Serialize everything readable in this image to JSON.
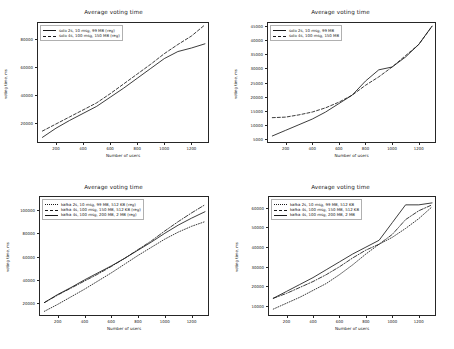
{
  "figure": {
    "layout": "2x2 grid of line charts",
    "panel_count": 4
  },
  "charts": [
    {
      "id": "top-left",
      "title": "Average voting time",
      "xlabel": "Number of users",
      "ylabel": "voting time, ms",
      "yticks": [
        "20000",
        "40000",
        "60000",
        "80000"
      ],
      "xticks": [
        "200",
        "400",
        "600",
        "800",
        "1000",
        "1200"
      ],
      "legend": [
        {
          "label": "solo 2s, 10 msg, 99 MB (reg)",
          "style": "solid"
        },
        {
          "label": "solo 4s, 100 msg, 150 MB (reg)",
          "style": "dashed"
        }
      ]
    },
    {
      "id": "top-right",
      "title": "Average voting time",
      "xlabel": "Number of users",
      "ylabel": "voting time, ms",
      "yticks": [
        "5000",
        "10000",
        "15000",
        "20000",
        "25000",
        "30000",
        "35000",
        "40000",
        "45000"
      ],
      "xticks": [
        "200",
        "400",
        "600",
        "800",
        "1000",
        "1200"
      ],
      "legend": [
        {
          "label": "solo 2s, 10 msg, 99 MB",
          "style": "solid"
        },
        {
          "label": "solo 4s, 100 msg, 150 MB",
          "style": "dashed"
        }
      ]
    },
    {
      "id": "bottom-left",
      "title": "Average voting time",
      "xlabel": "Number of users",
      "ylabel": "voting time, ms",
      "yticks": [
        "20000",
        "40000",
        "60000",
        "80000",
        "100000"
      ],
      "xticks": [
        "200",
        "400",
        "600",
        "800",
        "1000",
        "1200"
      ],
      "legend": [
        {
          "label": "kafka 2s, 10 msg, 99 MB, 512 KB (reg)",
          "style": "dotted"
        },
        {
          "label": "kafka 4s, 100 msg, 150 MB, 512 KB (reg)",
          "style": "dashdot"
        },
        {
          "label": "kafka 4s, 100 msg, 200 MB, 2 MB (reg)",
          "style": "solid"
        }
      ]
    },
    {
      "id": "bottom-right",
      "title": "Average voting time",
      "xlabel": "Number of users",
      "ylabel": "voting time, ms",
      "yticks": [
        "10000",
        "20000",
        "30000",
        "40000",
        "50000",
        "60000"
      ],
      "xticks": [
        "200",
        "400",
        "600",
        "800",
        "1000",
        "1200"
      ],
      "legend": [
        {
          "label": "kafka 2s, 10 msg, 99 MB, 512 KB",
          "style": "dotted"
        },
        {
          "label": "kafka 4s, 100 msg, 150 MB, 512 KB",
          "style": "dashdot"
        },
        {
          "label": "kafka 4s, 100 msg, 200 MB, 2 MB",
          "style": "solid"
        }
      ]
    }
  ],
  "chart_data": [
    {
      "type": "line",
      "panel": "top-left",
      "title": "Average voting time",
      "xlabel": "Number of users",
      "ylabel": "voting time, ms",
      "xlim": [
        60,
        1330
      ],
      "ylim": [
        6000,
        92000
      ],
      "grid": false,
      "legend_position": "upper left",
      "x": [
        100,
        200,
        300,
        400,
        500,
        600,
        700,
        800,
        900,
        1000,
        1100,
        1200,
        1300
      ],
      "series": [
        {
          "name": "solo 2s, 10 msg, 99 MB (reg)",
          "style": "solid",
          "color": "#1a1a1a",
          "values": [
            10000,
            16500,
            22000,
            27000,
            32000,
            38500,
            45000,
            52000,
            59000,
            66000,
            71000,
            73500,
            76500
          ]
        },
        {
          "name": "solo 4s, 100 msg, 150 MB (reg)",
          "style": "dashed",
          "color": "#1a1a1a",
          "values": [
            14500,
            19500,
            24500,
            29500,
            34500,
            41000,
            48000,
            55000,
            62000,
            69500,
            76000,
            82000,
            90000
          ]
        }
      ]
    },
    {
      "type": "line",
      "panel": "top-right",
      "title": "Average voting time",
      "xlabel": "Number of users",
      "ylabel": "voting time, ms",
      "xlim": [
        60,
        1330
      ],
      "ylim": [
        3500,
        46500
      ],
      "grid": false,
      "legend_position": "upper left",
      "x": [
        100,
        200,
        300,
        400,
        500,
        600,
        700,
        800,
        900,
        1000,
        1100,
        1200,
        1300
      ],
      "series": [
        {
          "name": "solo 2s, 10 msg, 99 MB",
          "style": "solid",
          "color": "#1a1a1a",
          "values": [
            6000,
            8000,
            10000,
            12000,
            14500,
            17500,
            20500,
            25500,
            29500,
            30500,
            34000,
            38500,
            45000
          ]
        },
        {
          "name": "solo 4s, 100 msg, 150 MB",
          "style": "dashed",
          "color": "#1a1a1a",
          "values": [
            12500,
            12700,
            13500,
            14500,
            16000,
            18000,
            20500,
            24000,
            27000,
            30500,
            34500,
            38500,
            45000
          ]
        }
      ]
    },
    {
      "type": "line",
      "panel": "bottom-left",
      "title": "Average voting time",
      "xlabel": "Number of users",
      "ylabel": "voting time, ms",
      "xlim": [
        60,
        1330
      ],
      "ylim": [
        9000,
        112000
      ],
      "grid": false,
      "legend_position": "upper left",
      "x": [
        100,
        200,
        300,
        400,
        500,
        600,
        700,
        800,
        900,
        1000,
        1100,
        1200,
        1300
      ],
      "series": [
        {
          "name": "kafka 2s, 10 msg, 99 MB, 512 KB (reg)",
          "style": "dotted",
          "color": "#1a1a1a",
          "values": [
            13000,
            19000,
            25500,
            32000,
            39000,
            46000,
            53500,
            61000,
            68000,
            75000,
            81000,
            86000,
            90000
          ]
        },
        {
          "name": "kafka 4s, 100 msg, 150 MB, 512 KB (reg)",
          "style": "dashdot",
          "color": "#1a1a1a",
          "values": [
            20500,
            27000,
            33000,
            39000,
            45000,
            51500,
            58500,
            66000,
            73500,
            82000,
            90000,
            97500,
            104500
          ]
        },
        {
          "name": "kafka 4s, 100 msg, 200 MB, 2 MB (reg)",
          "style": "solid",
          "color": "#1a1a1a",
          "values": [
            20500,
            27500,
            33500,
            40000,
            46000,
            52000,
            58500,
            65500,
            72500,
            80000,
            87000,
            93000,
            98500
          ]
        }
      ]
    },
    {
      "type": "line",
      "panel": "bottom-right",
      "title": "Average voting time",
      "xlabel": "Number of users",
      "ylabel": "voting time, ms",
      "xlim": [
        60,
        1330
      ],
      "ylim": [
        5000,
        66000
      ],
      "grid": false,
      "legend_position": "upper left",
      "x": [
        100,
        200,
        300,
        400,
        500,
        600,
        700,
        800,
        900,
        1000,
        1100,
        1200,
        1300
      ],
      "series": [
        {
          "name": "kafka 2s, 10 msg, 99 MB, 512 KB",
          "style": "dotted",
          "color": "#1a1a1a",
          "values": [
            8500,
            11500,
            14500,
            18000,
            21500,
            26000,
            31000,
            36500,
            41500,
            45000,
            49500,
            54500,
            60500
          ]
        },
        {
          "name": "kafka 4s, 100 msg, 150 MB, 512 KB",
          "style": "dashdot",
          "color": "#1a1a1a",
          "values": [
            14000,
            16500,
            19500,
            22500,
            26000,
            30000,
            34500,
            38500,
            41500,
            46500,
            54000,
            58500,
            61500
          ]
        },
        {
          "name": "kafka 4s, 100 msg, 200 MB, 2 MB",
          "style": "solid",
          "color": "#1a1a1a",
          "values": [
            14000,
            17500,
            21000,
            24500,
            28500,
            32500,
            36500,
            40000,
            43500,
            52500,
            61500,
            61500,
            62500
          ]
        }
      ]
    }
  ]
}
